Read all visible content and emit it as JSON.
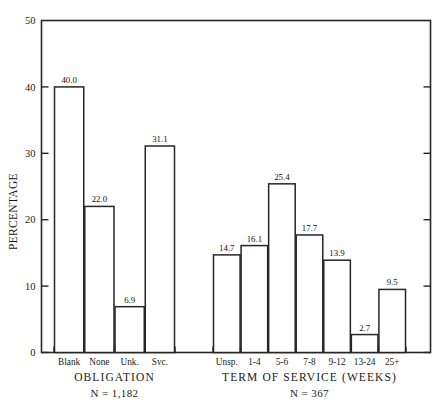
{
  "chart_data": {
    "type": "bar",
    "title": "",
    "subtitle": "",
    "xlabel": "",
    "ylabel": "PERCENTAGE",
    "ylim": [
      0,
      50
    ],
    "yticks": [
      0,
      10,
      20,
      30,
      40,
      50
    ],
    "ytick_labels": [
      "0",
      "10",
      "20",
      "30",
      "40",
      "50"
    ],
    "grid": false,
    "legend": null,
    "legend_position": "none",
    "bar_style": "contiguous-outline",
    "groups": [
      {
        "name": "OBLIGATION",
        "group_label": "OBLIGATION",
        "n_label": "N = 1,182",
        "n_value": 1182,
        "categories": [
          "Blank",
          "None",
          "Unk.",
          "Svc."
        ],
        "values": [
          40.0,
          22.0,
          6.9,
          31.1
        ],
        "value_labels": [
          "40.0",
          "22.0",
          "6.9",
          "31.1"
        ]
      },
      {
        "name": "TERM OF SERVICE (WEEKS)",
        "group_label": "TERM OF SERVICE (WEEKS)",
        "n_label": "N = 367",
        "n_value": 367,
        "categories": [
          "Unsp.",
          "1-4",
          "5-6",
          "7-8",
          "9-12",
          "13-24",
          "25+"
        ],
        "values": [
          14.7,
          16.1,
          25.4,
          17.7,
          13.9,
          2.7,
          9.5
        ],
        "value_labels": [
          "14.7",
          "16.1",
          "25.4",
          "17.7",
          "13.9",
          "2.7",
          "9.5"
        ]
      }
    ],
    "categories": [
      "Blank",
      "None",
      "Unk.",
      "Svc.",
      "Unsp.",
      "1-4",
      "5-6",
      "7-8",
      "9-12",
      "13-24",
      "25+"
    ],
    "values": [
      40.0,
      22.0,
      6.9,
      31.1,
      14.7,
      16.1,
      25.4,
      17.7,
      13.9,
      2.7,
      9.5
    ],
    "colors": {
      "ink": "#262626",
      "bar_fill": "#ffffff",
      "background": "#ffffff"
    }
  }
}
